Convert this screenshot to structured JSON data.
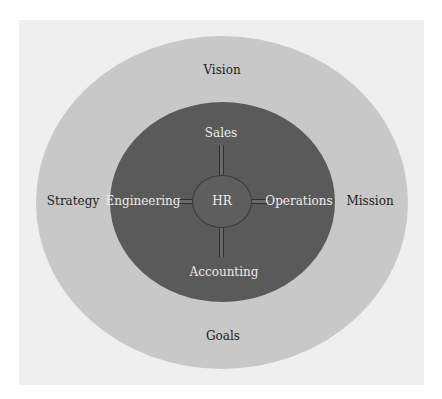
{
  "diagram": {
    "type": "nested-ellipses",
    "outer_ring": {
      "labels": {
        "top": "Vision",
        "left": "Strategy",
        "right": "Mission",
        "bottom": "Goals"
      }
    },
    "inner_ring": {
      "labels": {
        "top": "Sales",
        "left": "Engineering",
        "right": "Operations",
        "bottom": "Accounting"
      }
    },
    "hub": {
      "label": "HR"
    },
    "colors": {
      "background_panel": "#efefef",
      "outer_ellipse": "#c8c8c8",
      "inner_ellipse": "#5a5a5a",
      "hub": "#5e5e5e",
      "dark_text": "#1e1e1e",
      "light_text": "#ececec"
    }
  }
}
